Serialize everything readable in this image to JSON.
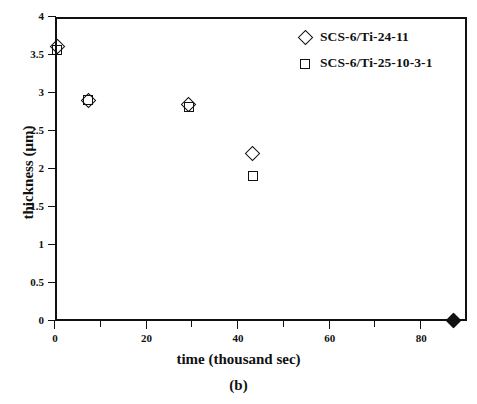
{
  "figure": {
    "caption": "(b)"
  },
  "chart_data": {
    "type": "scatter",
    "title": "",
    "xlabel": "time (thousand sec)",
    "ylabel": "thickness (μm)",
    "xlim": [
      0,
      90
    ],
    "ylim": [
      0,
      4
    ],
    "grid": false,
    "legend_position": "top-right",
    "xticks": [
      0,
      20,
      40,
      60,
      80
    ],
    "xtick_labels": [
      "0",
      "20",
      "40",
      "60",
      "80"
    ],
    "xminor_ticks": [
      10,
      30,
      50,
      70
    ],
    "yticks": [
      0,
      0.5,
      1,
      1.5,
      2,
      2.5,
      3,
      3.5,
      4
    ],
    "ytick_labels": [
      "0",
      "0.5",
      "1",
      "1.5",
      "2",
      "2.5",
      "3",
      "3.5",
      "4"
    ],
    "series": [
      {
        "name": "SCS-6/Ti-24-11",
        "marker": "open-diamond",
        "color": "#111111",
        "points": [
          {
            "x": 0.3,
            "y": 3.62
          },
          {
            "x": 7.0,
            "y": 2.92
          },
          {
            "x": 29.0,
            "y": 2.86
          },
          {
            "x": 43.0,
            "y": 2.22
          },
          {
            "x": 86.8,
            "y": 0.02
          }
        ]
      },
      {
        "name": "SCS-6/Ti-25-10-3-1",
        "marker": "open-square",
        "color": "#111111",
        "points": [
          {
            "x": 0.3,
            "y": 3.58
          },
          {
            "x": 7.0,
            "y": 2.92
          },
          {
            "x": 29.0,
            "y": 2.83
          },
          {
            "x": 43.0,
            "y": 1.92
          }
        ]
      }
    ]
  },
  "legend": {
    "items": [
      {
        "label": "SCS-6/Ti-24-11",
        "glyph": "diamond-icon"
      },
      {
        "label": "SCS-6/Ti-25-10-3-1",
        "glyph": "square-icon"
      }
    ]
  }
}
